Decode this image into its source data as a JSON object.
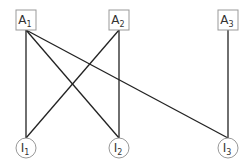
{
  "diagram": {
    "type": "bipartite-graph",
    "colors": {
      "edge": "#222222",
      "node_border": "#999999",
      "node_fill": "#ffffff",
      "text": "#333333"
    },
    "top_nodes": [
      {
        "id": "A1",
        "base": "A",
        "sub": "1",
        "shape": "square",
        "x": 26,
        "y": 20
      },
      {
        "id": "A2",
        "base": "A",
        "sub": "2",
        "shape": "square",
        "x": 119,
        "y": 20
      },
      {
        "id": "A3",
        "base": "A",
        "sub": "3",
        "shape": "square",
        "x": 228,
        "y": 20
      }
    ],
    "bottom_nodes": [
      {
        "id": "I1",
        "base": "I",
        "sub": "1",
        "shape": "circle",
        "x": 26,
        "y": 148
      },
      {
        "id": "I2",
        "base": "I",
        "sub": "2",
        "shape": "circle",
        "x": 119,
        "y": 148
      },
      {
        "id": "I3",
        "base": "I",
        "sub": "3",
        "shape": "circle",
        "x": 228,
        "y": 148
      }
    ],
    "edges": [
      {
        "from": "A1",
        "to": "I1"
      },
      {
        "from": "A1",
        "to": "I2"
      },
      {
        "from": "A1",
        "to": "I3"
      },
      {
        "from": "A2",
        "to": "I1"
      },
      {
        "from": "A2",
        "to": "I2"
      },
      {
        "from": "A3",
        "to": "I3"
      }
    ]
  }
}
